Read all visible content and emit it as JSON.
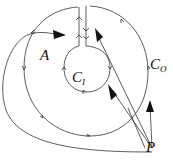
{
  "labels": {
    "A": {
      "text": "A"
    },
    "C_I": {
      "main": "C",
      "sub": "I"
    },
    "C_O": {
      "main": "C",
      "sub": "O"
    },
    "P": {
      "text": "P"
    }
  },
  "colors": {
    "stroke": "#333333",
    "background": "#ffffff"
  }
}
